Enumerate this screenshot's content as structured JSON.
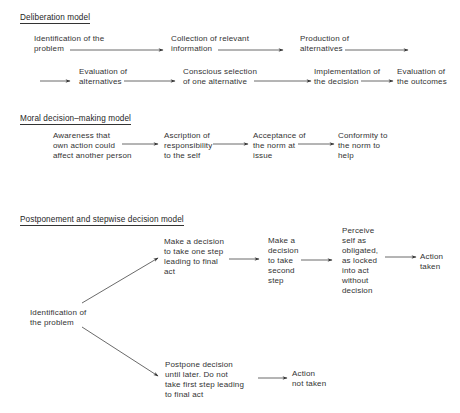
{
  "diagrams": [
    {
      "title": "Deliberation model",
      "nodes": [
        {
          "id": "d1",
          "label": "Identification of the\nproblem"
        },
        {
          "id": "d2",
          "label": "Collection of relevant\ninformation"
        },
        {
          "id": "d3",
          "label": "Production of\nalternatives"
        },
        {
          "id": "d4",
          "label": "Evaluation of\nalternatives"
        },
        {
          "id": "d5",
          "label": "Conscious selection\nof one alternative"
        },
        {
          "id": "d6",
          "label": "Implementation of\nthe decision"
        },
        {
          "id": "d7",
          "label": "Evaluation of\nthe outcomes"
        }
      ],
      "edges": [
        [
          "d1",
          "d2"
        ],
        [
          "d2",
          "d3"
        ],
        [
          "d3",
          "d4"
        ],
        [
          "d4",
          "d5"
        ],
        [
          "d5",
          "d6"
        ],
        [
          "d6",
          "d7"
        ]
      ]
    },
    {
      "title": "Moral decision–making model",
      "nodes": [
        {
          "id": "m1",
          "label": "Awareness that\nown action could\naffect another person"
        },
        {
          "id": "m2",
          "label": "Ascription of\nresponsibility\nto the self"
        },
        {
          "id": "m3",
          "label": "Acceptance of\nthe norm at\nissue"
        },
        {
          "id": "m4",
          "label": "Conformity to\nthe norm to\nhelp"
        }
      ],
      "edges": [
        [
          "m1",
          "m2"
        ],
        [
          "m2",
          "m3"
        ],
        [
          "m3",
          "m4"
        ]
      ]
    },
    {
      "title": "Postponement and stepwise decision model",
      "nodes": [
        {
          "id": "p1",
          "label": "Identification of\nthe problem"
        },
        {
          "id": "p2",
          "label": "Make a decision\nto take one step\nleading to final\nact"
        },
        {
          "id": "p3",
          "label": "Make a\ndecision\nto take\nsecond\nstep"
        },
        {
          "id": "p4",
          "label": "Perceive\nself as\nobligated,\nas locked\ninto act\nwithout\ndecision"
        },
        {
          "id": "p5",
          "label": "Action\ntaken"
        },
        {
          "id": "p6",
          "label": "Postpone decision\nuntil later. Do not\ntake first step leading\nto final act"
        },
        {
          "id": "p7",
          "label": "Action\nnot taken"
        }
      ],
      "edges": [
        [
          "p1",
          "p2"
        ],
        [
          "p2",
          "p3"
        ],
        [
          "p3",
          "p4"
        ],
        [
          "p4",
          "p5"
        ],
        [
          "p1",
          "p6"
        ],
        [
          "p6",
          "p7"
        ]
      ]
    }
  ]
}
